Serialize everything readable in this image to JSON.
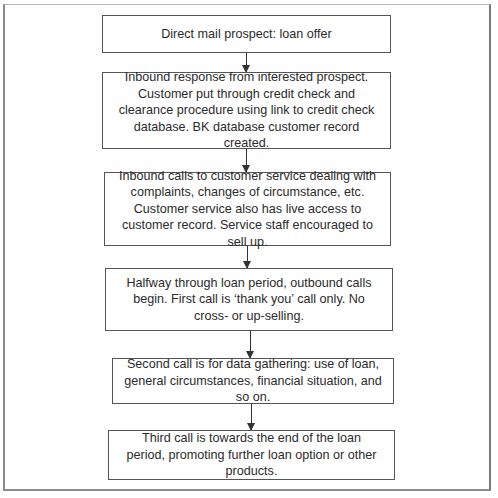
{
  "diagram": {
    "type": "flowchart",
    "direction": "top-to-bottom",
    "steps": [
      {
        "id": "step-1",
        "text": "Direct mail prospect: loan offer"
      },
      {
        "id": "step-2",
        "text": "Inbound response from interested prospect. Customer put through credit check and clearance procedure using link to credit check database. BK database customer record created."
      },
      {
        "id": "step-3",
        "text": "Inbound calls to customer service dealing with complaints, changes of circumstance, etc. Customer service also has live access to customer record. Service staff encouraged to sell up."
      },
      {
        "id": "step-4",
        "text": "Halfway through loan period, outbound calls begin. First call is ‘thank you’ call only. No cross- or up-selling."
      },
      {
        "id": "step-5",
        "text": "Second call is for data gathering: use of loan, general circumstances, financial situation, and so on."
      },
      {
        "id": "step-6",
        "text": "Third call is towards the end of the loan period, promoting further loan option or other products."
      }
    ],
    "connections": [
      {
        "from": "step-1",
        "to": "step-2"
      },
      {
        "from": "step-2",
        "to": "step-3"
      },
      {
        "from": "step-3",
        "to": "step-4"
      },
      {
        "from": "step-4",
        "to": "step-5"
      },
      {
        "from": "step-5",
        "to": "step-6"
      }
    ]
  },
  "colors": {
    "box_border": "#555555",
    "arrow": "#333333",
    "frame_border": "#8a8a8a",
    "text": "#2b2b2b",
    "background": "#ffffff"
  }
}
